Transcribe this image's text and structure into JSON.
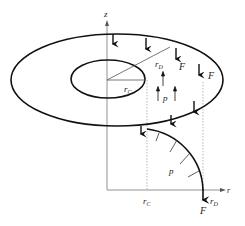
{
  "diagram": {
    "type": "annular-plate-loading",
    "labels": {
      "z_axis": "z",
      "r_axis": "r",
      "outer_radius": "r",
      "outer_radius_sub": "D",
      "inner_radius": "r",
      "inner_radius_sub": "C",
      "force_1": "F",
      "force_2": "F",
      "force_bottom": "F",
      "pressure_top": "p",
      "pressure_bottom": "p",
      "rC_tick": "r",
      "rC_tick_sub": "C",
      "rD_tick": "r",
      "rD_tick_sub": "D"
    },
    "colors": {
      "stroke": "#111111",
      "axis": "#777777",
      "dashed": "#999999"
    }
  }
}
